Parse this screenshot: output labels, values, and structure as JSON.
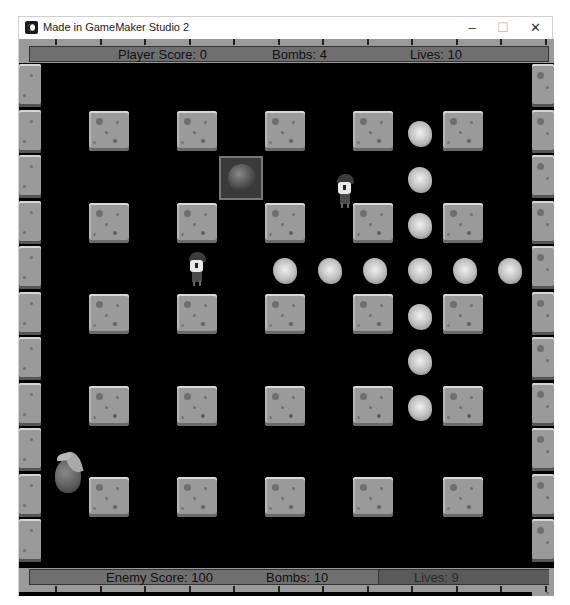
{
  "window": {
    "title": "Made in GameMaker Studio 2",
    "controls": {
      "minimize": "–",
      "maximize": "☐",
      "close": "✕"
    }
  },
  "hud_top": {
    "player_score": "Player Score: 0",
    "bombs": "Bombs: 4",
    "lives": "Lives: 10"
  },
  "hud_bottom": {
    "enemy_score": "Enemy Score: 100",
    "bombs": "Bombs: 10",
    "lives": "Lives: 9"
  },
  "board": {
    "background": "#000000",
    "block_columns_x": [
      70,
      158,
      246,
      334,
      424
    ],
    "block_rows_y": [
      72,
      164,
      255,
      347,
      438
    ],
    "crate": {
      "col": 2,
      "row": 1,
      "item": "bomb"
    },
    "player_1": {
      "x": 316,
      "y": 135
    },
    "player_2": {
      "x": 168,
      "y": 213
    },
    "fruit_powerup": {
      "x": 34,
      "y": 410
    },
    "explosions": [
      {
        "x": 389,
        "y": 82
      },
      {
        "x": 389,
        "y": 128
      },
      {
        "x": 389,
        "y": 174
      },
      {
        "x": 254,
        "y": 219
      },
      {
        "x": 299,
        "y": 219
      },
      {
        "x": 344,
        "y": 219
      },
      {
        "x": 389,
        "y": 219
      },
      {
        "x": 434,
        "y": 219
      },
      {
        "x": 479,
        "y": 219
      },
      {
        "x": 389,
        "y": 265
      },
      {
        "x": 389,
        "y": 310
      },
      {
        "x": 389,
        "y": 356
      }
    ]
  }
}
